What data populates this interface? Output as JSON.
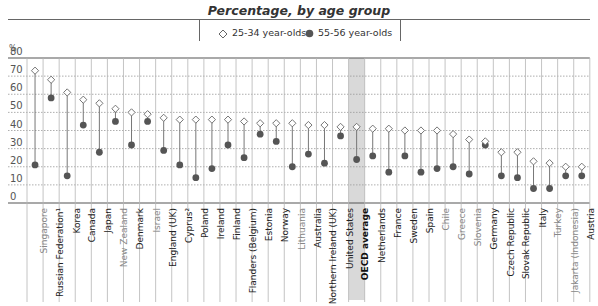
{
  "chart_data": {
    "type": "dot",
    "title": "Percentage, by age group",
    "ylabel": "%",
    "ylim": [
      0,
      80
    ],
    "yticks": [
      0,
      10,
      20,
      30,
      40,
      50,
      60,
      70,
      80
    ],
    "grid": true,
    "legend_position": "top",
    "categories": [
      "Singapore",
      "Russian Federation¹",
      "Korea",
      "Canada",
      "Japan",
      "New Zealand",
      "Denmark",
      "Israel",
      "England (UK)",
      "Cyprus²",
      "Poland",
      "Ireland",
      "Finland",
      "Flanders (Belgium)",
      "Estonia",
      "Norway",
      "Lithuania",
      "Australia",
      "Northern Ireland (UK)",
      "United States",
      "OECD average",
      "Netherlands",
      "France",
      "Sweden",
      "Spain",
      "Chile",
      "Greece",
      "Slovenia",
      "Germany",
      "Czech Republic",
      "Slovak Republic",
      "Italy",
      "Turkey",
      "Jakarta (Indonesia)",
      "Austria"
    ],
    "series": [
      {
        "name": "25-34 year-olds",
        "marker": "open-diamond",
        "values": [
          73,
          68,
          61,
          57,
          55,
          52,
          50,
          49,
          47,
          46,
          46,
          46,
          46,
          45,
          44,
          44,
          44,
          43,
          43,
          42,
          42,
          41,
          41,
          40,
          40,
          40,
          38,
          35,
          34,
          28,
          28,
          23,
          22,
          20,
          20
        ]
      },
      {
        "name": "55-56 year-olds",
        "marker": "filled-circle",
        "values": [
          21,
          58,
          15,
          43,
          28,
          45,
          32,
          45,
          29,
          21,
          14,
          19,
          32,
          25,
          38,
          34,
          20,
          27,
          22,
          37,
          24,
          26,
          17,
          26,
          17,
          19,
          20,
          16,
          32,
          15,
          14,
          8,
          8,
          15,
          15
        ]
      }
    ],
    "highlighted_category": "OECD average",
    "light_label_categories": [
      "Singapore",
      "New Zealand",
      "Israel",
      "Lithuania",
      "Chile",
      "Greece",
      "Slovenia",
      "Turkey",
      "Jakarta (Indonesia)"
    ]
  },
  "header": {
    "title_fragment": "",
    "subtitle": "Percentage, by age group"
  },
  "legend": {
    "item_a": "25-34 year-olds",
    "item_b": "55-56 year-olds"
  },
  "axis": {
    "unit": "%"
  },
  "colors": {
    "dot": "#555555",
    "diamond_stroke": "#666666",
    "grid": "#999999",
    "highlight": "#d9d9d9",
    "light_label": "#888888"
  }
}
